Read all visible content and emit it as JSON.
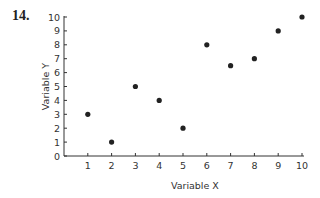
{
  "question_number": "14.",
  "chart_data": {
    "type": "scatter",
    "title": "",
    "xlabel": "Variable X",
    "ylabel": "Variable Y",
    "xlim": [
      0,
      10
    ],
    "ylim": [
      0,
      10
    ],
    "x_ticks": [
      1,
      2,
      3,
      4,
      5,
      6,
      7,
      8,
      9,
      10
    ],
    "y_ticks": [
      0,
      1,
      2,
      3,
      4,
      5,
      6,
      7,
      8,
      9,
      10
    ],
    "grid": false,
    "legend": null,
    "points": [
      {
        "x": 1,
        "y": 3
      },
      {
        "x": 2,
        "y": 1
      },
      {
        "x": 3,
        "y": 5
      },
      {
        "x": 4,
        "y": 4
      },
      {
        "x": 5,
        "y": 2
      },
      {
        "x": 6,
        "y": 8
      },
      {
        "x": 7,
        "y": 6.5
      },
      {
        "x": 8,
        "y": 7
      },
      {
        "x": 9,
        "y": 9
      },
      {
        "x": 10,
        "y": 10
      }
    ]
  }
}
